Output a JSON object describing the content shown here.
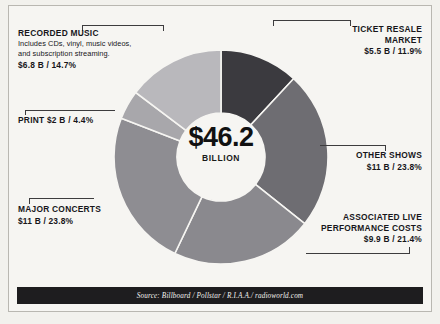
{
  "chart_data": {
    "type": "pie",
    "title": "",
    "center_total": "$46.2",
    "center_unit": "BILLION",
    "total_value": 46.2,
    "unit": "billion USD",
    "legend_position": "callouts",
    "grid": false,
    "categories": [
      "TICKET RESALE MARKET",
      "OTHER SHOWS",
      "ASSOCIATED LIVE PERFORMANCE COSTS",
      "MAJOR CONCERTS",
      "PRINT",
      "RECORDED MUSIC"
    ],
    "values": [
      5.5,
      11,
      9.9,
      11,
      2,
      6.8
    ],
    "percentages": [
      11.9,
      23.8,
      21.4,
      23.8,
      4.4,
      14.7
    ],
    "colors": [
      "#3b3a3f",
      "#6e6d72",
      "#8a898e",
      "#8e8d92",
      "#a8a7ab",
      "#b9b8bc"
    ],
    "annotations": [
      "Includes CDs, vinyl, music videos, and subscription streaming."
    ]
  },
  "callouts": {
    "recorded_music": {
      "title": "RECORDED MUSIC",
      "sub_line1": "Includes CDs, vinyl, music videos,",
      "sub_line2": "and subscription streaming.",
      "value": "$6.8 B / 14.7%"
    },
    "print": {
      "value": "PRINT $2 B / 4.4%"
    },
    "major_concerts": {
      "title": "MAJOR CONCERTS",
      "value": "$11 B / 23.8%"
    },
    "ticket_resale": {
      "title": "TICKET RESALE MARKET",
      "value": "$5.5 B / 11.9%"
    },
    "other_shows": {
      "title": "OTHER SHOWS",
      "value": "$11 B / 23.8%"
    },
    "associated_live": {
      "title_line1": "ASSOCIATED LIVE",
      "title_line2": "PERFORMANCE COSTS",
      "value": "$9.9 B / 21.4%"
    }
  },
  "footer": {
    "source": "Source: Billboard / Pollstar / R.I.A.A./ radioworld.com"
  }
}
